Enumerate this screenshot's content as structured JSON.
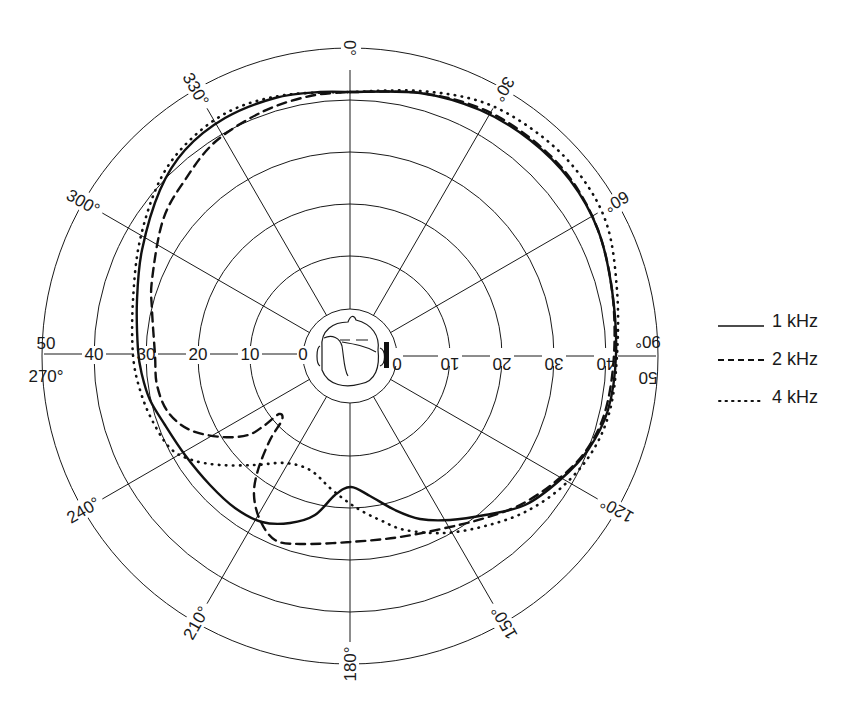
{
  "chart_data": {
    "type": "polar-line",
    "title": "",
    "center_px": [
      350,
      356
    ],
    "radial_axis": {
      "unit": "dB",
      "ticks": [
        0,
        10,
        20,
        30,
        40,
        50
      ],
      "ring_radii_px": [
        47,
        100,
        152,
        204,
        256,
        308
      ],
      "range": [
        0,
        50
      ]
    },
    "angular_axis": {
      "unit": "degrees",
      "spoke_step": 30,
      "direction": "clockwise",
      "zero_at": "top",
      "tick_labels": [
        "0°",
        "30°",
        "60°",
        "90°",
        "120°",
        "150°",
        "180°",
        "210°",
        "240°",
        "270°",
        "300°",
        "330°"
      ]
    },
    "axis_labels_left": [
      "50",
      "40",
      "30",
      "20",
      "10",
      "0"
    ],
    "axis_labels_right": [
      "0",
      "10",
      "20",
      "30",
      "40",
      "50"
    ],
    "center_icon": "listener-head-with-ear-marker",
    "legend_position": "right",
    "series": [
      {
        "name": "1 kHz",
        "style": "solid",
        "approx_values_db": {
          "0": 41,
          "30": 42,
          "60": 42,
          "90": 41,
          "120": 40,
          "150": 36,
          "180": 25,
          "210": 34,
          "240": 36,
          "270": 33,
          "300": 38,
          "330": 41
        },
        "points_px": [
          [
            350,
            92
          ],
          [
            420,
            93
          ],
          [
            480,
            110
          ],
          [
            530,
            140
          ],
          [
            570,
            180
          ],
          [
            598,
            230
          ],
          [
            612,
            290
          ],
          [
            616,
            355
          ],
          [
            608,
            410
          ],
          [
            588,
            450
          ],
          [
            560,
            480
          ],
          [
            525,
            505
          ],
          [
            485,
            515
          ],
          [
            450,
            520
          ],
          [
            420,
            519
          ],
          [
            395,
            510
          ],
          [
            370,
            496
          ],
          [
            351,
            487
          ],
          [
            335,
            495
          ],
          [
            315,
            515
          ],
          [
            290,
            523
          ],
          [
            262,
            522
          ],
          [
            235,
            508
          ],
          [
            210,
            485
          ],
          [
            185,
            455
          ],
          [
            165,
            425
          ],
          [
            150,
            400
          ],
          [
            142,
            375
          ],
          [
            138,
            350
          ],
          [
            137,
            300
          ],
          [
            142,
            250
          ],
          [
            160,
            190
          ],
          [
            185,
            150
          ],
          [
            225,
            118
          ],
          [
            275,
            98
          ],
          [
            320,
            92
          ],
          [
            350,
            92
          ]
        ]
      },
      {
        "name": "2 kHz",
        "style": "dashed",
        "approx_values_db": {
          "0": 41,
          "30": 42,
          "60": 42,
          "90": 41,
          "120": 39,
          "150": 37,
          "180": 36,
          "210": 32,
          "240": 25,
          "270": 30,
          "300": 36,
          "330": 39
        },
        "points_px": [
          [
            350,
            92
          ],
          [
            420,
            93
          ],
          [
            480,
            108
          ],
          [
            530,
            138
          ],
          [
            570,
            178
          ],
          [
            598,
            230
          ],
          [
            612,
            290
          ],
          [
            614,
            355
          ],
          [
            605,
            412
          ],
          [
            585,
            452
          ],
          [
            555,
            482
          ],
          [
            520,
            505
          ],
          [
            485,
            518
          ],
          [
            450,
            527
          ],
          [
            400,
            537
          ],
          [
            350,
            542
          ],
          [
            300,
            544
          ],
          [
            275,
            540
          ],
          [
            260,
            520
          ],
          [
            254,
            495
          ],
          [
            258,
            470
          ],
          [
            270,
            440
          ],
          [
            282,
            420
          ],
          [
            279,
            414
          ],
          [
            265,
            425
          ],
          [
            248,
            435
          ],
          [
            222,
            437
          ],
          [
            190,
            430
          ],
          [
            168,
            412
          ],
          [
            157,
            385
          ],
          [
            155,
            355
          ],
          [
            152,
            310
          ],
          [
            152,
            280
          ],
          [
            163,
            220
          ],
          [
            185,
            180
          ],
          [
            215,
            142
          ],
          [
            262,
            112
          ],
          [
            310,
            96
          ],
          [
            350,
            92
          ]
        ]
      },
      {
        "name": "4 kHz",
        "style": "dotted",
        "approx_values_db": {
          "0": 41,
          "30": 43,
          "60": 43,
          "90": 41,
          "120": 40,
          "150": 37,
          "180": 29,
          "210": 28,
          "240": 33,
          "270": 33,
          "300": 38,
          "330": 41
        },
        "points_px": [
          [
            350,
            92
          ],
          [
            420,
            91
          ],
          [
            485,
            103
          ],
          [
            540,
            135
          ],
          [
            580,
            175
          ],
          [
            607,
            225
          ],
          [
            617,
            290
          ],
          [
            617,
            355
          ],
          [
            610,
            410
          ],
          [
            592,
            452
          ],
          [
            562,
            487
          ],
          [
            525,
            512
          ],
          [
            485,
            526
          ],
          [
            445,
            533
          ],
          [
            405,
            530
          ],
          [
            380,
            520
          ],
          [
            360,
            510
          ],
          [
            345,
            500
          ],
          [
            330,
            488
          ],
          [
            310,
            470
          ],
          [
            285,
            463
          ],
          [
            255,
            465
          ],
          [
            220,
            465
          ],
          [
            192,
            460
          ],
          [
            170,
            448
          ],
          [
            152,
            420
          ],
          [
            140,
            390
          ],
          [
            133,
            355
          ],
          [
            133,
            300
          ],
          [
            140,
            240
          ],
          [
            160,
            180
          ],
          [
            190,
            140
          ],
          [
            232,
            110
          ],
          [
            285,
            95
          ],
          [
            350,
            92
          ]
        ]
      }
    ]
  },
  "legend": {
    "items": [
      {
        "label": "1 kHz",
        "style": "solid"
      },
      {
        "label": "2 kHz",
        "style": "dashed"
      },
      {
        "label": "4 kHz",
        "style": "dotted"
      }
    ]
  }
}
